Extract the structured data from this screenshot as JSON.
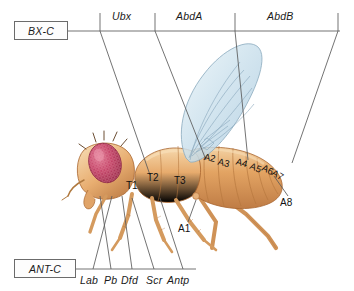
{
  "figure": {
    "background_color": "#ffffff",
    "line_color": "#5a5a5a"
  },
  "clusters": {
    "bithorax": {
      "box_label": "BX-C",
      "axis_y": 31,
      "axis_x_start": 68,
      "axis_x_end": 340,
      "genes": [
        {
          "label": "Ubx",
          "x": 112,
          "y": 10,
          "tick_x": 100,
          "lead_to_x": 150,
          "lead_to_y": 175
        },
        {
          "label": "AbdA",
          "x": 176,
          "y": 10,
          "tick_x": 155,
          "lead_to_x": 206,
          "lead_to_y": 160
        },
        {
          "label": "AbdB",
          "x": 267,
          "y": 10,
          "tick_x": 235,
          "lead_to_x": 248,
          "lead_to_y": 160
        }
      ],
      "end_tick_x": 338,
      "end_lead_to_x": 292,
      "end_lead_to_y": 163
    },
    "antennapedia": {
      "box_label": "ANT-C",
      "axis_y": 269,
      "axis_x_start": 76,
      "axis_x_end": 196,
      "genes": [
        {
          "label": "Lab",
          "x": 80,
          "y": 274,
          "tick_x": 93,
          "lead_to_x": 112,
          "lead_to_y": 196
        },
        {
          "label": "Pb",
          "x": 104,
          "y": 274,
          "tick_x": 111,
          "lead_to_x": 100,
          "lead_to_y": 196
        },
        {
          "label": "Dfd",
          "x": 121,
          "y": 274,
          "tick_x": 132,
          "lead_to_x": 122,
          "lead_to_y": 196
        },
        {
          "label": "Scr",
          "x": 146,
          "y": 274,
          "tick_x": 154,
          "lead_to_x": 132,
          "lead_to_y": 198
        },
        {
          "label": "Antp",
          "x": 167,
          "y": 274,
          "tick_x": 183,
          "lead_to_x": 160,
          "lead_to_y": 198
        }
      ]
    }
  },
  "segments": {
    "thoracic": [
      {
        "label": "T1",
        "x": 126,
        "y": 180,
        "rotate": 0
      },
      {
        "label": "T2",
        "x": 147,
        "y": 172,
        "rotate": 0
      },
      {
        "label": "T3",
        "x": 174,
        "y": 175,
        "rotate": 0
      }
    ],
    "abdominal": [
      {
        "label": "A1",
        "x": 178,
        "y": 223,
        "rotate": 0
      },
      {
        "label": "A2",
        "x": 204,
        "y": 152,
        "rotate": 12
      },
      {
        "label": "A3",
        "x": 218,
        "y": 157,
        "rotate": 14
      },
      {
        "label": "A4",
        "x": 236,
        "y": 157,
        "rotate": 16
      },
      {
        "label": "A5",
        "x": 250,
        "y": 162,
        "rotate": 22
      },
      {
        "label": "A6",
        "x": 262,
        "y": 164,
        "rotate": 26
      },
      {
        "label": "A7",
        "x": 272,
        "y": 169,
        "rotate": 32
      },
      {
        "label": "A8",
        "x": 280,
        "y": 197,
        "rotate": 0
      }
    ]
  },
  "fly": {
    "body_color": "#e2a264",
    "body_highlight": "#f2cfa0",
    "eye_color": "#c0395a",
    "wing_color": "#cfe4ee",
    "wing_vein_color": "#7d97ab"
  }
}
